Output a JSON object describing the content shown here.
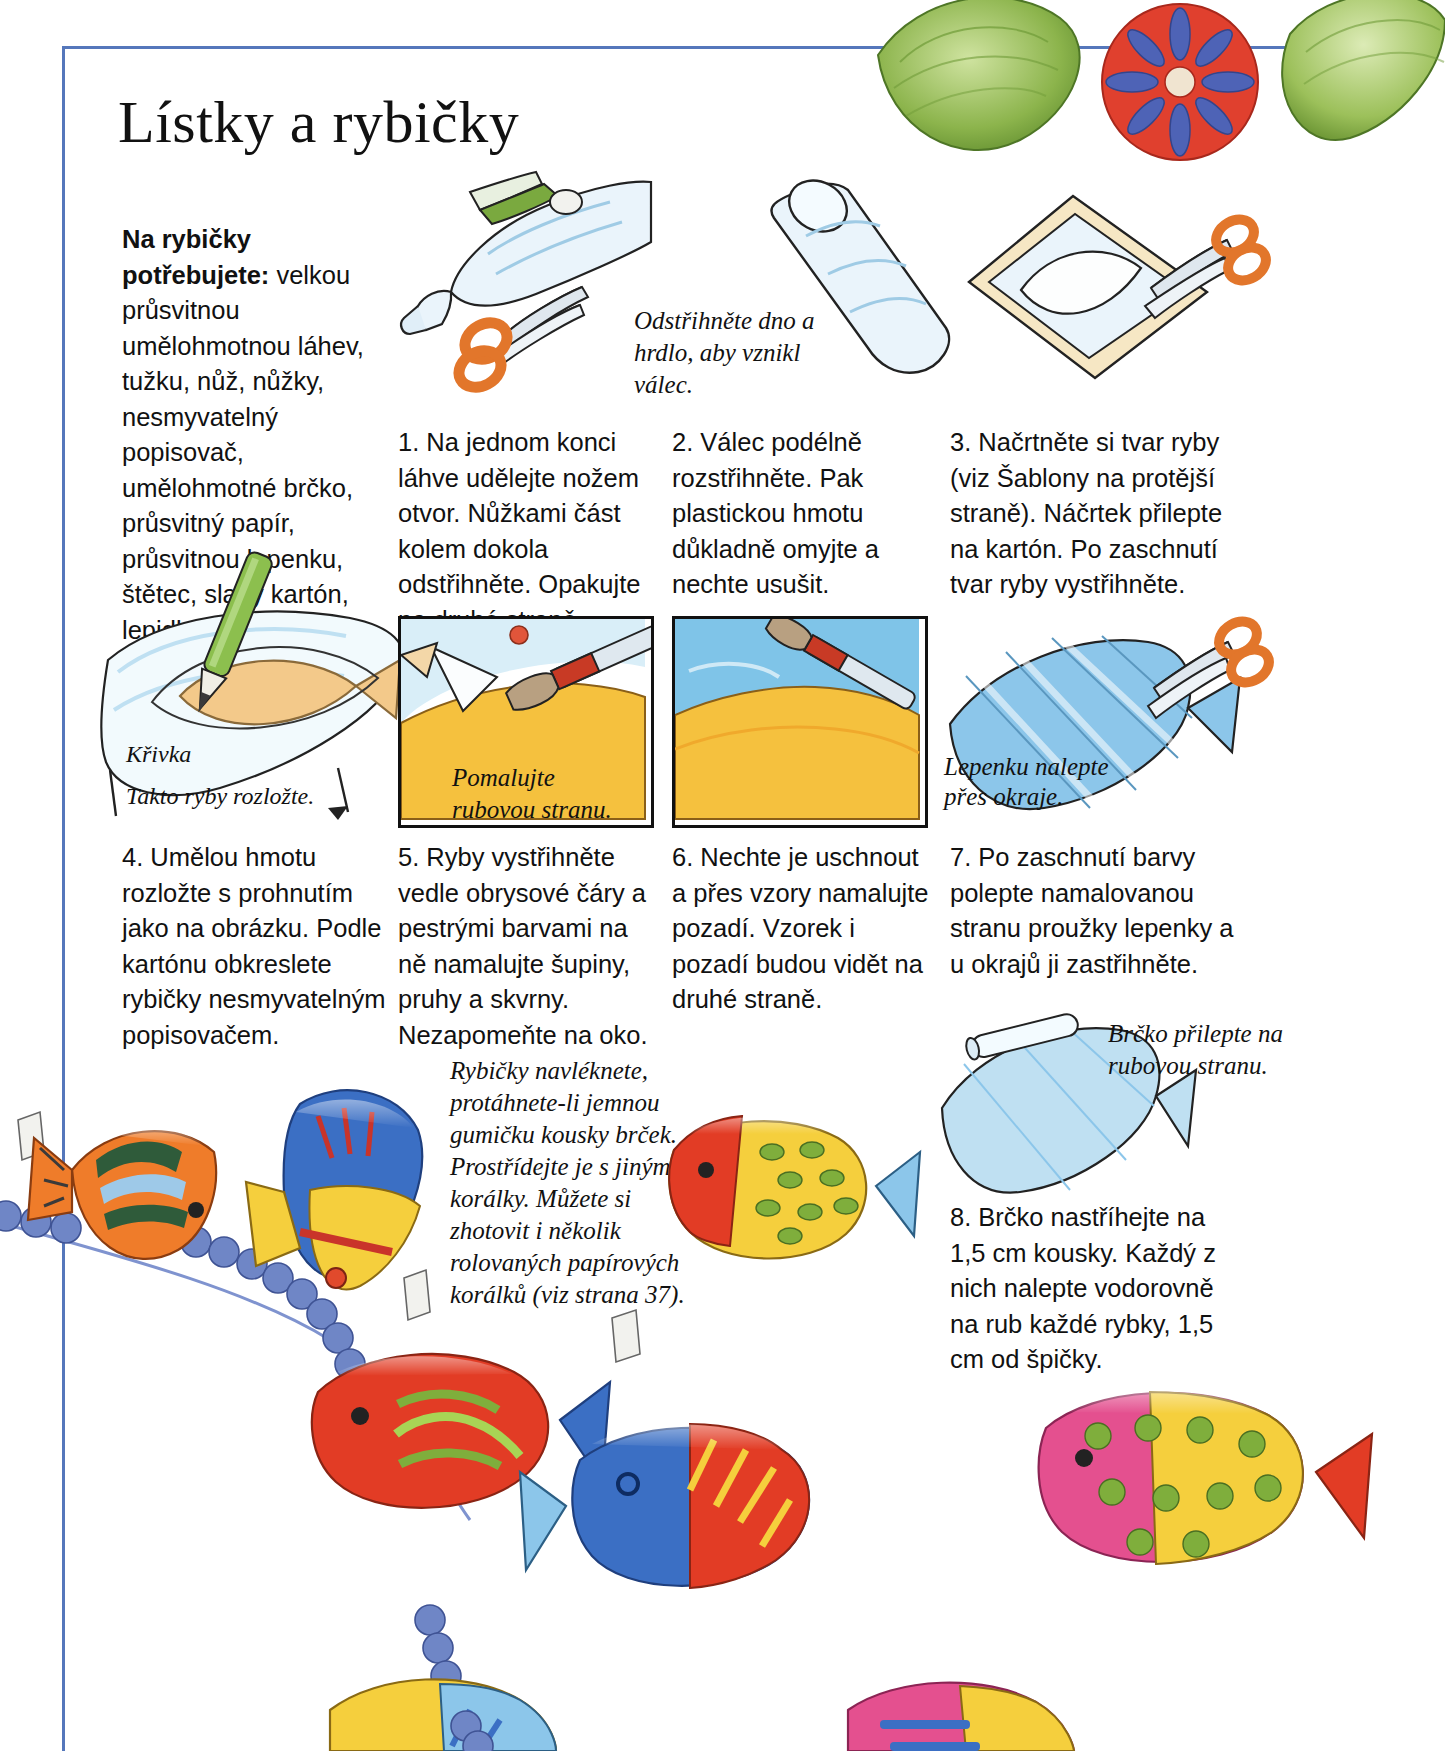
{
  "page": {
    "title": "Lístky a rybičky",
    "language": "cs",
    "frame_color": "#5577bb"
  },
  "materials": {
    "heading": "Na rybičky potřebujete:",
    "text": " velkou průsvitnou umělohmotnou láhev, tužku, nůž, nůžky, nesmyvatelný popisovač, umělohmotné brčko, průsvitný papír, průsvitnou lepenku, štětec, slabý kartón, lepidlo v tyčince, akrylové barvy."
  },
  "steps": [
    {
      "number": "1.",
      "text": "1. Na jednom konci láhve udělejte nožem otvor. Nůžkami část kolem dokola odstřihněte. Opakujte na druhé straně."
    },
    {
      "number": "2.",
      "text": "2. Válec podélně rozstřihněte. Pak plastickou hmotu důkladně omyjte a nechte usušit."
    },
    {
      "number": "3.",
      "text": "3. Načrtněte si tvar ryby (viz Šablony na protější straně). Náčrtek přilepte na kartón. Po zaschnutí tvar ryby vystřihněte."
    },
    {
      "number": "4.",
      "text": "4. Umělou hmotu rozložte s prohnutím jako na obrázku. Podle kartónu obkreslete rybičky nesmyvatelným popisovačem."
    },
    {
      "number": "5.",
      "text": "5. Ryby vystřihněte vedle obrysové čáry a pestrými barvami na ně namalujte šupiny, pruhy a skvrny. Nezapomeňte na oko."
    },
    {
      "number": "6.",
      "text": "6. Nechte je uschnout a přes vzory namalujte pozadí. Vzorek i pozadí budou vidět na druhé straně."
    },
    {
      "number": "7.",
      "text": "7. Po zaschnutí barvy polepte namalovanou stranu proužky lepenky a u okrajů ji zastřihněte."
    },
    {
      "number": "8.",
      "text": "8. Brčko nastříhejte na 1,5 cm kousky. Každý z nich nalepte vodorovně na rub každé rybky, 1,5 cm od špičky."
    }
  ],
  "captions": {
    "bottle": "Odstřihněte dno a hrdlo, aby vznikl válec.",
    "krivka": "Křivka",
    "takto": "Takto ryby rozložte.",
    "pomalujte": "Pomalujte rubovou stranu.",
    "lepenku": "Lepenku nalepte přes okraje.",
    "brcko": "Brčko přilepte na rubovou stranu.",
    "navleknete": "Rybičky navléknete, protáhnete-li jemnou gumičku kousky brček. Prostřídejte je s jinými korálky. Můžete si zhotovit i několik rolovaných papírových korálků (viz strana 37)."
  },
  "colors": {
    "fish_orange": "#ef7c2a",
    "fish_red": "#e33a26",
    "fish_blue": "#3b6fc4",
    "fish_lightblue": "#8cc6ea",
    "fish_yellow": "#f5cf3d",
    "fish_green": "#7fae3c",
    "fish_pink": "#e4508f",
    "bead_blue": "#6f86c6",
    "leaf_green": "#7ba83f",
    "paint_tan": "#f3c98a",
    "paper_blue": "#bfe0f2"
  }
}
